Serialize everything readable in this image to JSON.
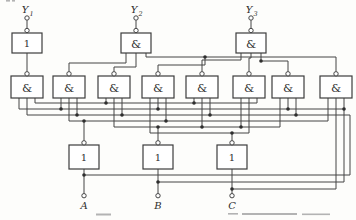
{
  "figure": {
    "outputs": [
      {
        "label": "Y",
        "sub": "1"
      },
      {
        "label": "Y",
        "sub": "2"
      },
      {
        "label": "Y",
        "sub": "3"
      }
    ],
    "inputs": [
      {
        "label": "A"
      },
      {
        "label": "B"
      },
      {
        "label": "C"
      }
    ],
    "gates": {
      "row1": [
        {
          "symbol": "1"
        },
        {
          "symbol": "&"
        },
        {
          "symbol": "&"
        }
      ],
      "row2": [
        {
          "symbol": "&"
        },
        {
          "symbol": "&"
        },
        {
          "symbol": "&"
        },
        {
          "symbol": "&"
        },
        {
          "symbol": "&"
        },
        {
          "symbol": "&"
        },
        {
          "symbol": "&"
        },
        {
          "symbol": "&"
        }
      ],
      "row3": [
        {
          "symbol": "1"
        },
        {
          "symbol": "1"
        },
        {
          "symbol": "1"
        }
      ]
    },
    "colors": {
      "line": "#454545",
      "background": "#fdfdfb",
      "box_fill": "#ffffff",
      "caption_gray": "#b3b3b3"
    }
  }
}
